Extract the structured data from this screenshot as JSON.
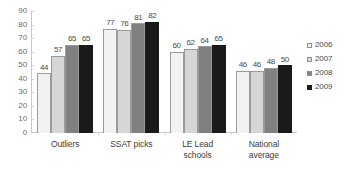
{
  "chart_data": {
    "type": "bar",
    "title": "",
    "subtitle": "",
    "xlabel": "",
    "ylabel": "",
    "ylim": [
      0,
      90
    ],
    "y_ticks": [
      0,
      10,
      20,
      30,
      40,
      50,
      60,
      70,
      80,
      90
    ],
    "grid": false,
    "legend_position": "right",
    "categories": [
      "Outliers",
      "SSAT picks",
      "LE Lead schools",
      "National average"
    ],
    "category_lines": [
      [
        "Outliers"
      ],
      [
        "SSAT picks"
      ],
      [
        "LE Lead",
        "schools"
      ],
      [
        "National",
        "average"
      ]
    ],
    "series": [
      {
        "name": "2006",
        "color": "#f2f2f2",
        "values": [
          44,
          77,
          60,
          46
        ]
      },
      {
        "name": "2007",
        "color": "#d6d6d6",
        "values": [
          57,
          76,
          62,
          46
        ]
      },
      {
        "name": "2008",
        "color": "#808080",
        "values": [
          65,
          81,
          64,
          48
        ]
      },
      {
        "name": "2009",
        "color": "#1a1a1a",
        "values": [
          65,
          82,
          65,
          50
        ]
      }
    ],
    "data_labels": [
      [
        "44",
        "57",
        "65",
        "65"
      ],
      [
        "77",
        "76",
        "81",
        "82"
      ],
      [
        "60",
        "62",
        "64",
        "65"
      ],
      [
        "46",
        "46",
        "48",
        "50"
      ]
    ]
  },
  "legend": {
    "items": [
      {
        "label": "2006",
        "color": "#f2f2f2"
      },
      {
        "label": "2007",
        "color": "#d6d6d6"
      },
      {
        "label": "2008",
        "color": "#808080"
      },
      {
        "label": "2009",
        "color": "#1a1a1a"
      }
    ]
  },
  "axis": {
    "y_tick_labels": [
      "90",
      "80",
      "70",
      "60",
      "50",
      "40",
      "30",
      "20",
      "10",
      "0"
    ]
  }
}
